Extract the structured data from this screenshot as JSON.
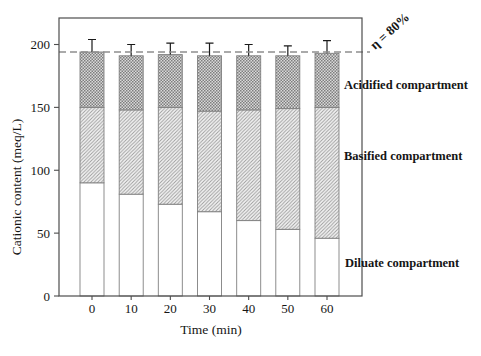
{
  "chart_data": {
    "type": "bar",
    "stacked": true,
    "title": "",
    "xlabel": "Time (min)",
    "ylabel": "Cationic content (meq/L)",
    "categories": [
      "0",
      "10",
      "20",
      "30",
      "40",
      "50",
      "60"
    ],
    "series": [
      {
        "name": "Diluate compartment",
        "pattern": "plain",
        "values": [
          90,
          81,
          73,
          67,
          60,
          53,
          46
        ]
      },
      {
        "name": "Basified compartment",
        "pattern": "diagonal-hatch",
        "values": [
          60,
          67,
          77,
          80,
          88,
          96,
          104
        ]
      },
      {
        "name": "Acidified compartment",
        "pattern": "checker",
        "values": [
          44,
          43,
          42,
          44,
          43,
          42,
          43
        ]
      }
    ],
    "stack_totals": [
      194,
      191,
      192,
      191,
      191,
      191,
      193
    ],
    "error_bars_plus": [
      10,
      9,
      9,
      10,
      9,
      8,
      10
    ],
    "yticks": [
      0,
      50,
      100,
      150,
      200
    ],
    "ylim": [
      0,
      220
    ],
    "grid": false,
    "legend_position": "right-annotations",
    "reference_line": {
      "value": 194,
      "label": "η = 80%",
      "style": "dashed",
      "color": "#8f8f8f"
    },
    "colors": {
      "background": "#ffffff",
      "frame": "#4d4d4d",
      "bar_border": "#808080",
      "hatch_line": "#9a9a9a",
      "hatch_bg": "#f4f4f4",
      "checker_dark": "#7e7e7e",
      "checker_light": "#d9d9d9",
      "error_bar": "#1a1a1a",
      "text": "#151515"
    }
  }
}
